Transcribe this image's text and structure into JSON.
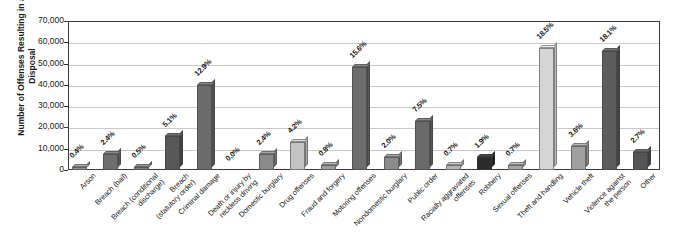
{
  "chart_data": {
    "type": "bar",
    "title": "",
    "xlabel": "",
    "ylabel": "Number of Offenses Resulting in a Disposal",
    "ylim": [
      0,
      70000
    ],
    "ytick_labels": [
      "70,000",
      "60,000",
      "50,000",
      "40,000",
      "30,000",
      "20,000",
      "10,000",
      "0"
    ],
    "ytick_values": [
      70000,
      60000,
      50000,
      40000,
      30000,
      20000,
      10000,
      0
    ],
    "grid": true,
    "legend": "none",
    "categories": [
      "Arson",
      "Breach (bail)",
      "Breach (conditional discharge)",
      "Breach (statutory order)",
      "Criminal damage",
      "Death or injury by reckless driving",
      "Domestic burglary",
      "Drug offenses",
      "Fraud and forgery",
      "Motoring offenses",
      "Nondomestic burglary",
      "Public order",
      "Racially aggravated offenses",
      "Robbery",
      "Sexual offenses",
      "Theft and handling",
      "Vehicle theft",
      "Violence against the person",
      "Other"
    ],
    "category_lines": [
      [
        "Arson"
      ],
      [
        "Breach (bail)"
      ],
      [
        "Breach (conditional",
        "discharge)"
      ],
      [
        "Breach",
        "(statutory order)"
      ],
      [
        "Criminal damage"
      ],
      [
        "Death or injury by",
        "reckless driving"
      ],
      [
        "Domestic burglary"
      ],
      [
        "Drug offenses"
      ],
      [
        "Fraud and forgery"
      ],
      [
        "Motoring offenses"
      ],
      [
        "Nondomestic burglary"
      ],
      [
        "Public order"
      ],
      [
        "Racially aggravated",
        "offenses"
      ],
      [
        "Robbery"
      ],
      [
        "Sexual offenses"
      ],
      [
        "Theft and handling"
      ],
      [
        "Vehicle theft"
      ],
      [
        "Violence against",
        "the person"
      ],
      [
        "Other"
      ]
    ],
    "data_labels": [
      "0.4%",
      "2.4%",
      "0.5%",
      "5.1%",
      "12.9%",
      "0.0%",
      "2.4%",
      "4.2%",
      "0.8%",
      "15.6%",
      "2.0%",
      "7.5%",
      "0.7%",
      "1.9%",
      "0.7%",
      "18.5%",
      "3.6%",
      "18.1%",
      "2.7%"
    ],
    "percentages": [
      0.4,
      2.4,
      0.5,
      5.1,
      12.9,
      0.0,
      2.4,
      4.2,
      0.8,
      15.6,
      2.0,
      7.5,
      0.7,
      1.9,
      0.7,
      18.5,
      3.6,
      18.1,
      2.7
    ],
    "values": [
      1240,
      7440,
      1550,
      15810,
      39990,
      0,
      7440,
      13020,
      2480,
      48360,
      6200,
      23250,
      2170,
      5890,
      2170,
      57350,
      11160,
      56110,
      8370
    ],
    "bar_colors": [
      "#8f8f8f",
      "#6e6e6e",
      "#7b7b7b",
      "#585858",
      "#6b6b6b",
      "#9a9a9a",
      "#8a8a8a",
      "#c3c3c3",
      "#9c9c9c",
      "#6d6d6d",
      "#8c8c8c",
      "#6a6a6a",
      "#b4b4b4",
      "#2b2b2b",
      "#a6a6a6",
      "#d5d5d5",
      "#a0a0a0",
      "#5c5c5c",
      "#555555"
    ]
  }
}
